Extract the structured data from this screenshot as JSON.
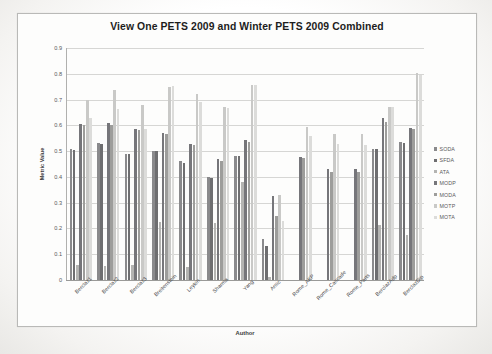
{
  "chart": {
    "title": "View One PETS 2009 and Winter PETS 2009 Combined",
    "xlabel": "Author",
    "ylabel": "Metric Value"
  },
  "chart_data": {
    "type": "bar",
    "title": "View One PETS 2009 and Winter PETS 2009 Combined",
    "xlabel": "Author",
    "ylabel": "Metric Value",
    "ylim": [
      0,
      0.9
    ],
    "ytick_labels": [
      "0.9",
      "0.8",
      "0.7",
      "0.6",
      "0.5",
      "0.4",
      "0.3",
      "0.2",
      "0.1",
      "0"
    ],
    "ytick_values": [
      0.9,
      0.8,
      0.7,
      0.6,
      0.5,
      0.4,
      0.3,
      0.2,
      0.1,
      0
    ],
    "grid": true,
    "legend_position": "right",
    "categories": [
      "Berclaz1",
      "Berclaz2",
      "Berclaz3",
      "Breitenstein",
      "Leykin",
      "Sharma",
      "Yang",
      "Arsic",
      "Rome_AKP",
      "Rome_Cascade",
      "Rome_Parts",
      "BerclazAdp",
      "BerclazDip"
    ],
    "series": [
      {
        "name": "SODA",
        "color": "#8a8a8c",
        "values": [
          0.51,
          0.53,
          0.49,
          0.5,
          0.46,
          0.4,
          0.48,
          0.16,
          null,
          null,
          null,
          0.51,
          0.535
        ]
      },
      {
        "name": "SFDA",
        "color": "#6e6e70",
        "values": [
          0.505,
          0.527,
          0.49,
          0.5,
          0.455,
          0.395,
          0.48,
          0.133,
          null,
          null,
          null,
          0.508,
          0.53
        ]
      },
      {
        "name": "ATA",
        "color": "#b4b4b2",
        "values": [
          0.06,
          0.055,
          0.058,
          0.225,
          0.05,
          0.22,
          0.38,
          0.012,
          null,
          null,
          null,
          0.215,
          0.175
        ]
      },
      {
        "name": "MODP",
        "color": "#76767a",
        "values": [
          0.605,
          0.608,
          0.585,
          0.57,
          0.528,
          0.468,
          0.542,
          0.326,
          0.478,
          0.43,
          0.43,
          0.628,
          0.59
        ]
      },
      {
        "name": "MODA",
        "color": "#9d9d9b",
        "values": [
          0.6,
          0.6,
          0.583,
          0.565,
          0.525,
          0.462,
          0.535,
          0.248,
          0.475,
          0.418,
          0.418,
          0.613,
          0.585
        ]
      },
      {
        "name": "MOTP",
        "color": "#c9c9c7",
        "values": [
          0.7,
          0.738,
          0.68,
          0.748,
          0.72,
          0.672,
          0.755,
          0.33,
          0.595,
          0.568,
          0.568,
          0.672,
          0.803
        ]
      },
      {
        "name": "MOTA",
        "color": "#dcdcda",
        "values": [
          0.63,
          0.665,
          0.585,
          0.752,
          0.692,
          0.668,
          0.758,
          0.228,
          0.558,
          0.527,
          0.525,
          0.672,
          0.797
        ]
      }
    ]
  },
  "legend": {
    "items": [
      {
        "label": "SODA"
      },
      {
        "label": "SFDA"
      },
      {
        "label": "ATA"
      },
      {
        "label": "MODP"
      },
      {
        "label": "MODA"
      },
      {
        "label": "MOTP"
      },
      {
        "label": "MOTA"
      }
    ]
  }
}
